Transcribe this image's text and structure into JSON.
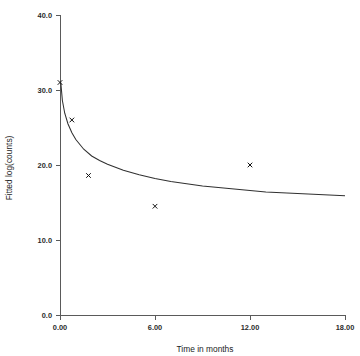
{
  "chart_data": {
    "type": "line",
    "title": "",
    "title_clipped_note": "",
    "xlabel": "Time in months",
    "ylabel": "Fitted log(counts)",
    "xlim": [
      0,
      18
    ],
    "ylim": [
      0,
      40
    ],
    "xticks": [
      0,
      6,
      12,
      18
    ],
    "xtick_labels": [
      "0.00",
      "6.00",
      "12.00",
      "18.00"
    ],
    "yticks": [
      0,
      10,
      20,
      30,
      40
    ],
    "ytick_labels": [
      "0.0",
      "10.0",
      "20.0",
      "30.0",
      "40.0"
    ],
    "grid": false,
    "legend": false,
    "series": [
      {
        "name": "Observed",
        "type": "scatter",
        "marker": "x",
        "points": [
          {
            "x": 0.0,
            "y": 31.0
          },
          {
            "x": 0.75,
            "y": 26.0
          },
          {
            "x": 1.8,
            "y": 18.6
          },
          {
            "x": 6.0,
            "y": 14.5
          },
          {
            "x": 12.0,
            "y": 20.0
          }
        ]
      },
      {
        "name": "Fitted curve",
        "type": "line",
        "points": [
          {
            "x": 0.05,
            "y": 31.0
          },
          {
            "x": 0.15,
            "y": 28.6
          },
          {
            "x": 0.3,
            "y": 26.9
          },
          {
            "x": 0.5,
            "y": 25.5
          },
          {
            "x": 0.75,
            "y": 24.3
          },
          {
            "x": 1.0,
            "y": 23.4
          },
          {
            "x": 1.5,
            "y": 22.1
          },
          {
            "x": 2.0,
            "y": 21.2
          },
          {
            "x": 2.5,
            "y": 20.6
          },
          {
            "x": 3.0,
            "y": 20.1
          },
          {
            "x": 4.0,
            "y": 19.3
          },
          {
            "x": 5.0,
            "y": 18.7
          },
          {
            "x": 6.0,
            "y": 18.2
          },
          {
            "x": 7.0,
            "y": 17.8
          },
          {
            "x": 8.0,
            "y": 17.5
          },
          {
            "x": 9.0,
            "y": 17.2
          },
          {
            "x": 10.0,
            "y": 17.0
          },
          {
            "x": 11.0,
            "y": 16.8
          },
          {
            "x": 12.0,
            "y": 16.6
          },
          {
            "x": 13.0,
            "y": 16.4
          },
          {
            "x": 14.0,
            "y": 16.3
          },
          {
            "x": 15.0,
            "y": 16.2
          },
          {
            "x": 16.0,
            "y": 16.1
          },
          {
            "x": 17.0,
            "y": 16.0
          },
          {
            "x": 18.0,
            "y": 15.9
          }
        ]
      }
    ]
  },
  "axis": {
    "x_title": "Time in months",
    "y_title": "Fitted log(counts)"
  },
  "colors": {
    "axis": "#5a5a5a",
    "curve": "#303030",
    "marker": "#111111",
    "tick_text": "#2b2b2b",
    "background": "#ffffff"
  }
}
